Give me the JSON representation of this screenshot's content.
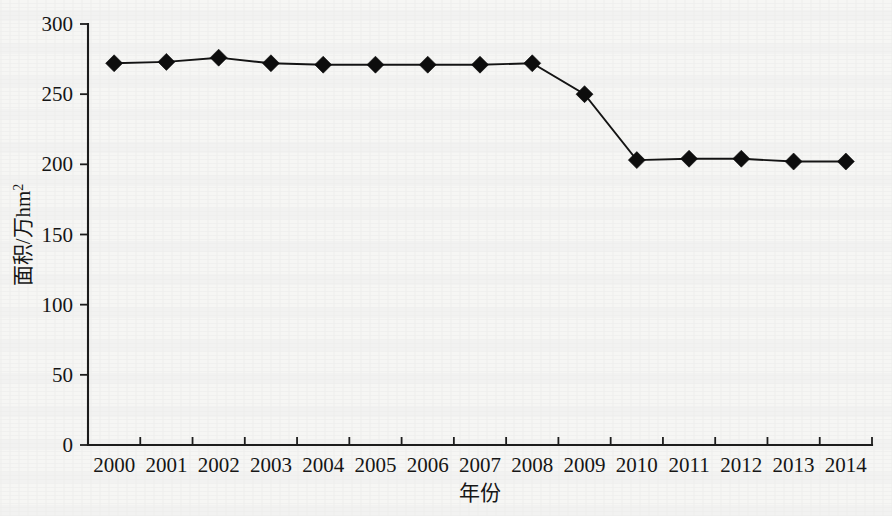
{
  "chart_data": {
    "type": "line",
    "title": "",
    "subtitle": "",
    "xlabel": "年份",
    "ylabel": "面积/万hm²",
    "ylabel_base": "面积/万hm",
    "ylabel_sup": "2",
    "categories": [
      "2000",
      "2001",
      "2002",
      "2003",
      "2004",
      "2005",
      "2006",
      "2007",
      "2008",
      "2009",
      "2010",
      "2011",
      "2012",
      "2013",
      "2014"
    ],
    "values": [
      272,
      273,
      276,
      272,
      271,
      271,
      271,
      271,
      272,
      250,
      203,
      204,
      204,
      202,
      202
    ],
    "series": [
      {
        "name": "面积",
        "values": [
          272,
          273,
          276,
          272,
          271,
          271,
          271,
          271,
          272,
          250,
          203,
          204,
          204,
          202,
          202
        ]
      }
    ],
    "ylim": [
      0,
      300
    ],
    "y_ticks": [
      0,
      50,
      100,
      150,
      200,
      250,
      300
    ],
    "y_tick_labels": [
      "0",
      "50",
      "100",
      "150",
      "200",
      "250",
      "300"
    ],
    "x_tick_labels": [
      "2000",
      "2001",
      "2002",
      "2003",
      "2004",
      "2005",
      "2006",
      "2007",
      "2008",
      "2009",
      "2010",
      "2011",
      "2012",
      "2013",
      "2014"
    ],
    "grid": false,
    "legend": false,
    "legend_position": "none",
    "marker": "diamond",
    "line_color": "#141414",
    "marker_color": "#0d0d0d",
    "axis_color": "#1c1c1c",
    "background_color": "#f6f6f4"
  }
}
